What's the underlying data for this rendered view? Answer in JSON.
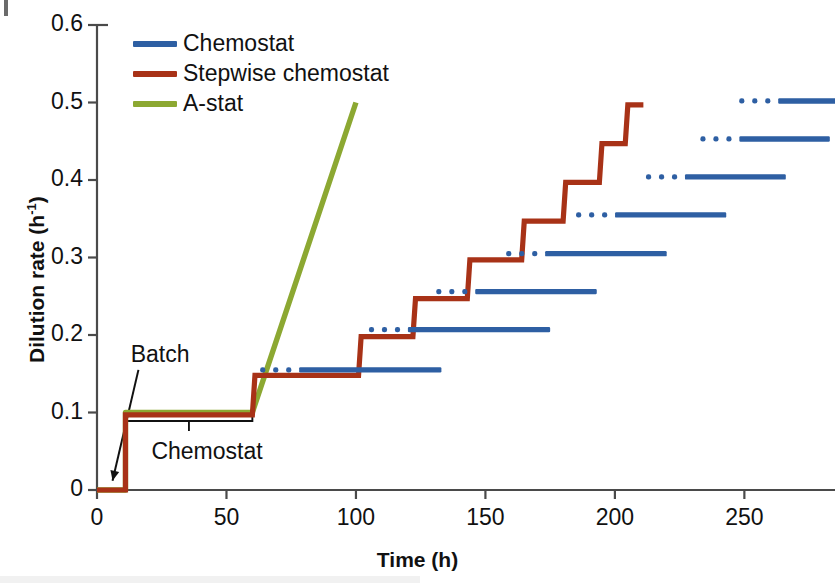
{
  "chart_data": {
    "type": "line",
    "title": "",
    "xlabel": "Time (h)",
    "ylabel": "Dilution rate (h-1)",
    "ylabel_display": "Dilution rate (h",
    "ylabel_sup": "-1",
    "ylabel_tail": ")",
    "xlim": [
      0,
      285
    ],
    "ylim": [
      0,
      0.6
    ],
    "xticks": [
      0,
      50,
      100,
      150,
      200,
      250
    ],
    "yticks": [
      0,
      0.1,
      0.2,
      0.3,
      0.4,
      0.5,
      0.6
    ],
    "xtick_labels": [
      "0",
      "50",
      "100",
      "150",
      "200",
      "250"
    ],
    "ytick_labels": [
      "0",
      "0.1",
      "0.2",
      "0.3",
      "0.4",
      "0.5",
      "0.6"
    ],
    "grid": false,
    "legend_position": "upper left inside",
    "series": [
      {
        "name": "Chemostat",
        "color": "#2E5FA3",
        "style": "dashed-horizontal-runs",
        "runs": [
          {
            "level": 0.155,
            "x_start": 63,
            "x_end": 133,
            "dots": 3
          },
          {
            "level": 0.207,
            "x_start": 105,
            "x_end": 175,
            "dots": 3
          },
          {
            "level": 0.256,
            "x_start": 131,
            "x_end": 193,
            "dots": 3
          },
          {
            "level": 0.305,
            "x_start": 158,
            "x_end": 220,
            "dots": 3
          },
          {
            "level": 0.355,
            "x_start": 185,
            "x_end": 243,
            "dots": 3
          },
          {
            "level": 0.404,
            "x_start": 212,
            "x_end": 266,
            "dots": 3
          },
          {
            "level": 0.453,
            "x_start": 233,
            "x_end": 283,
            "dots": 3
          },
          {
            "level": 0.502,
            "x_start": 248,
            "x_end": 288,
            "dots": 3
          }
        ]
      },
      {
        "name": "Stepwise chemostat",
        "color": "#A83217",
        "style": "step",
        "points": [
          {
            "x": 0,
            "y": 0
          },
          {
            "x": 11,
            "y": 0
          },
          {
            "x": 11,
            "y": 0.097
          },
          {
            "x": 60,
            "y": 0.097
          },
          {
            "x": 61,
            "y": 0.148
          },
          {
            "x": 101,
            "y": 0.148
          },
          {
            "x": 102,
            "y": 0.198
          },
          {
            "x": 122,
            "y": 0.198
          },
          {
            "x": 123,
            "y": 0.247
          },
          {
            "x": 143,
            "y": 0.247
          },
          {
            "x": 144,
            "y": 0.297
          },
          {
            "x": 164,
            "y": 0.297
          },
          {
            "x": 165,
            "y": 0.347
          },
          {
            "x": 180,
            "y": 0.347
          },
          {
            "x": 181,
            "y": 0.397
          },
          {
            "x": 194,
            "y": 0.397
          },
          {
            "x": 195,
            "y": 0.447
          },
          {
            "x": 204,
            "y": 0.447
          },
          {
            "x": 205,
            "y": 0.497
          },
          {
            "x": 211,
            "y": 0.497
          }
        ]
      },
      {
        "name": "A-stat",
        "color": "#8CA832",
        "style": "solid",
        "points": [
          {
            "x": 0,
            "y": 0
          },
          {
            "x": 11,
            "y": 0
          },
          {
            "x": 11,
            "y": 0.1
          },
          {
            "x": 60,
            "y": 0.1
          },
          {
            "x": 100,
            "y": 0.5
          }
        ]
      }
    ],
    "annotations": [
      {
        "name": "batch",
        "text": "Batch",
        "x": 13,
        "y": 0.172,
        "arrow_from": {
          "x": 16,
          "y": 0.155
        },
        "arrow_to": {
          "x": 6,
          "y": 0.012
        }
      },
      {
        "name": "chemostat-phase",
        "text": "Chemostat",
        "x": 21,
        "y": 0.047,
        "bracket_x_start": 11,
        "bracket_x_end": 60,
        "bracket_y": 0.089
      }
    ]
  },
  "legend": {
    "items": [
      {
        "label": "Chemostat",
        "color": "#2E5FA3"
      },
      {
        "label": "Stepwise chemostat",
        "color": "#A83217"
      },
      {
        "label": "A-stat",
        "color": "#8CA832"
      }
    ]
  },
  "axes": {
    "x_title": "Time (h)",
    "y_title_main": "Dilution rate (h",
    "y_title_sup": "-1",
    "y_title_end": ")",
    "axis_color": "#4a4a4a"
  }
}
